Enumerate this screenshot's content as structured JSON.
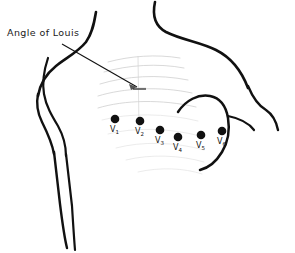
{
  "diagram": {
    "title": "Angle of Louis",
    "background_color": "#ffffff",
    "outline_color": "#111111",
    "rib_shading_color": "#c9c9c9",
    "electrode_color": "#111111"
  },
  "callout": {
    "label": "Angle of Louis",
    "pointer_from": {
      "x": 62,
      "y": 44
    },
    "pointer_to": {
      "x": 139,
      "y": 88
    }
  },
  "electrodes": [
    {
      "id": "V1",
      "letter": "V",
      "number": "1",
      "cx": 115,
      "cy": 119,
      "r": 4.3,
      "label_x": 110,
      "label_y": 132
    },
    {
      "id": "V2",
      "letter": "V",
      "number": "2",
      "cx": 140,
      "cy": 121,
      "r": 4.3,
      "label_x": 135,
      "label_y": 134
    },
    {
      "id": "V3",
      "letter": "V",
      "number": "3",
      "cx": 160,
      "cy": 130,
      "r": 4.3,
      "label_x": 155,
      "label_y": 143
    },
    {
      "id": "V4",
      "letter": "V",
      "number": "4",
      "cx": 178,
      "cy": 137,
      "r": 4.3,
      "label_x": 173,
      "label_y": 150
    },
    {
      "id": "V5",
      "letter": "V",
      "number": "5",
      "cx": 201,
      "cy": 135,
      "r": 4.3,
      "label_x": 196,
      "label_y": 148
    },
    {
      "id": "V6",
      "letter": "V",
      "number": "6",
      "cx": 222,
      "cy": 131,
      "r": 4.3,
      "label_x": 217,
      "label_y": 144
    }
  ],
  "contours": {
    "neck_right": "M 155 2 C 152 16 155 26 166 32 C 182 40 200 42 216 50 C 232 58 242 72 248 88",
    "shoulder_right_arm": "M 248 86 C 253 98 259 106 266 110 C 272 114 276 120 278 130",
    "neck_left": "M 96 12 C 94 24 92 34 86 42 C 78 52 66 58 56 66 C 46 74 40 84 38 96",
    "torso_left": "M 38 94 C 36 104 38 114 42 122 C 47 132 52 142 54 154",
    "arm_left_inner": "M 48 58 C 44 70 42 82 44 94 C 46 106 52 116 58 126 C 63 135 66 145 66 156",
    "arm_left_outer": "M 54 152 C 56 168 58 186 60 204 C 62 220 64 236 67 248",
    "arm_left_inner_low": "M 66 154 C 68 170 70 188 72 206 C 73 222 74 238 75 250",
    "breast_curve": "M 178 112 C 186 100 198 94 210 96 C 220 98 226 106 228 118 C 230 130 228 142 222 152 C 216 162 208 168 200 170",
    "breast_lower": "M 228 116 C 238 118 248 122 254 130"
  },
  "ribs": [
    "M 108 62 C 130 56 156 54 180 58",
    "M 104 72 C 128 65 158 63 184 68",
    "M 100 84 C 126 76 158 74 188 80",
    "M 98 96 C 124 88 160 86 192 93",
    "M 98 108 C 124 100 162 99 196 107",
    "M 102 120 C 128 113 166 113 198 121",
    "M 108 134 C 134 127 170 128 200 136",
    "M 116 148 C 142 141 176 142 204 150",
    "M 126 160 C 150 154 180 155 204 162",
    "M 138 172 C 160 167 184 168 202 174"
  ],
  "sternum": [
    "M 138 56 L 139 128",
    "M 132 88 L 146 88"
  ]
}
